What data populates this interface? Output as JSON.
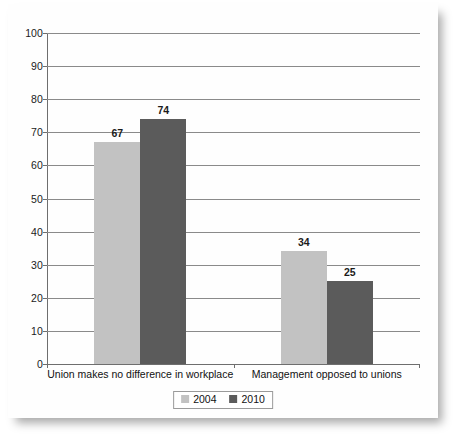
{
  "chart_data": {
    "type": "bar",
    "title": "",
    "subtitle": "",
    "xlabel": "",
    "ylabel": "",
    "categories": [
      "Union makes no difference in workplace",
      "Management opposed to unions"
    ],
    "series": [
      {
        "name": "2004",
        "values": [
          67,
          34
        ],
        "color": "#c2c2c2"
      },
      {
        "name": "2010",
        "values": [
          74,
          25
        ],
        "color": "#5b5b5b"
      }
    ],
    "ylim": [
      0,
      100
    ],
    "ytick_step": 10,
    "yticks": [
      0,
      10,
      20,
      30,
      40,
      50,
      60,
      70,
      80,
      90,
      100
    ],
    "ytick_labels": [
      "0",
      "10",
      "20",
      "30",
      "40",
      "50",
      "60",
      "70",
      "80",
      "90",
      "100"
    ],
    "grid": true,
    "grid_axis": "y",
    "legend_position": "bottom",
    "data_labels": [
      "67",
      "74",
      "34",
      "25"
    ],
    "annotations": []
  },
  "legend": {
    "items": [
      {
        "label": "2004",
        "color": "#c2c2c2"
      },
      {
        "label": "2010",
        "color": "#5b5b5b"
      }
    ]
  },
  "axis": {
    "x_categories": [
      "Union makes no difference in workplace",
      "Management opposed to unions"
    ]
  }
}
